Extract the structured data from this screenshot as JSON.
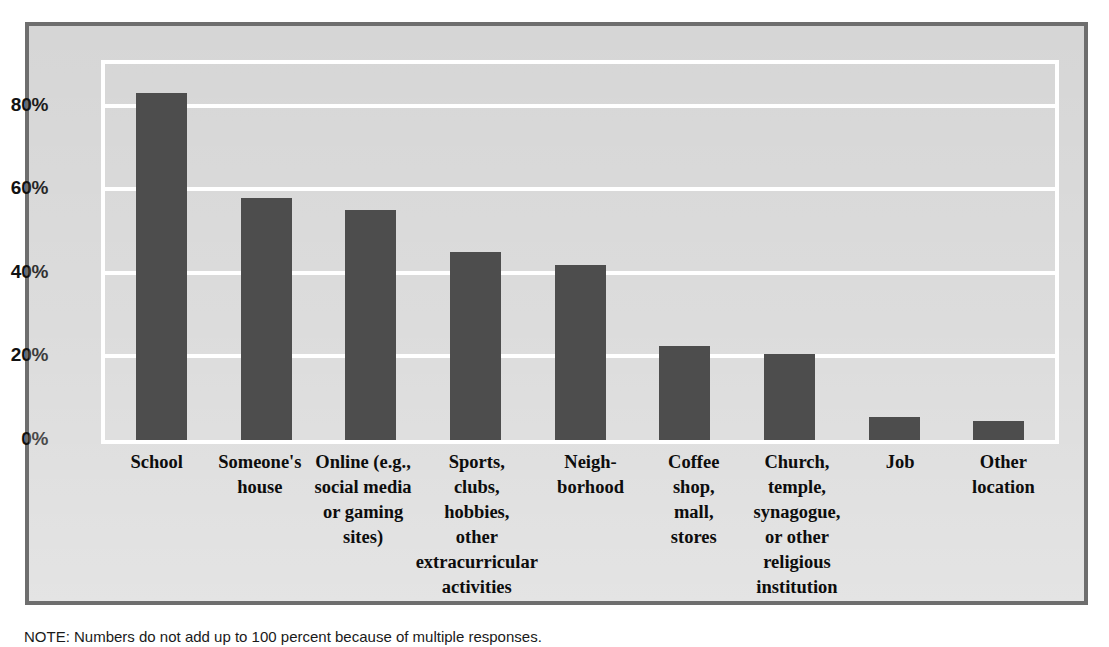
{
  "figure": {
    "frame_border_color": "#6e6e6e",
    "background_color": "#d6d6d6",
    "plot_border_color": "#ffffff",
    "bar_color": "#4d4d4d",
    "gridline_color": "#ffffff"
  },
  "note": {
    "prefix": "NOTE:",
    "text": "NOTE: Numbers do not add up to 100 percent because of multiple responses."
  },
  "chart_data": {
    "type": "bar",
    "title": "",
    "subtitle": "",
    "xlabel": "",
    "ylabel": "",
    "ylim": [
      0,
      90
    ],
    "grid": true,
    "legend": "none",
    "orientation": "vertical",
    "yticks": [
      0,
      20,
      40,
      60,
      80
    ],
    "ytick_labels": [
      "0%",
      "20%",
      "40%",
      "60%",
      "80%"
    ],
    "categories": [
      "School",
      "Someone's\nhouse",
      "Online (e.g.,\nsocial media\nor gaming\nsites)",
      "Sports,\nclubs,\nhobbies,\nother\nextracurricular\nactivities",
      "Neigh-\nborhood",
      "Coffee\nshop,\nmall,\nstores",
      "Church,\ntemple,\nsynagogue,\nor other\nreligious\ninstitution",
      "Job",
      "Other\nlocation"
    ],
    "values": [
      83,
      58,
      55,
      45,
      42,
      22.5,
      20.5,
      5.5,
      4.5
    ],
    "value_labels": [
      "83%",
      "58%",
      "55%",
      "45%",
      "42%",
      "22%",
      "20%",
      "6%",
      "4%"
    ]
  }
}
